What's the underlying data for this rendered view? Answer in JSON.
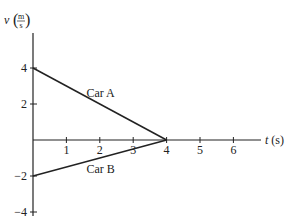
{
  "chart_data": {
    "type": "line",
    "title": "",
    "xlabel": "t (s)",
    "ylabel": "v (m/s)",
    "ylabel_parts": {
      "var": "v",
      "num": "m",
      "den": "s"
    },
    "xlim": [
      0,
      6.8
    ],
    "ylim": [
      -4,
      6.5
    ],
    "xticks": [
      1,
      2,
      3,
      4,
      5,
      6
    ],
    "yticks": [
      4,
      2,
      -2,
      -4
    ],
    "grid": false,
    "legend": null,
    "series": [
      {
        "name": "Car A",
        "x": [
          0,
          4
        ],
        "y": [
          4,
          0
        ]
      },
      {
        "name": "Car B",
        "x": [
          0,
          4
        ],
        "y": [
          -2,
          0
        ]
      }
    ],
    "annotations": [
      {
        "text": "Car A",
        "x": 1.6,
        "y": 2.6
      },
      {
        "text": "Car B",
        "x": 1.6,
        "y": -1.6
      }
    ]
  }
}
